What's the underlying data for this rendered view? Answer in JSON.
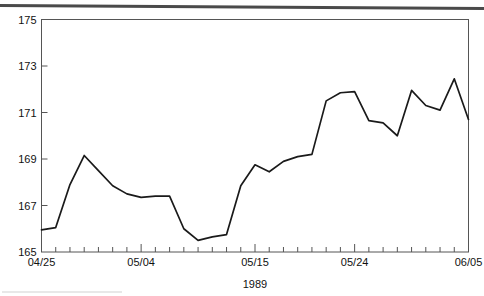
{
  "page": {
    "background_color": "#ffffff",
    "line_color": "#1a1a1a",
    "axis_color": "#555555"
  },
  "chart_data": {
    "type": "line",
    "title": "",
    "subtitle": "",
    "xlabel": "1989",
    "ylabel": "",
    "ylim": [
      165,
      175
    ],
    "ytick_labels": [
      "165",
      "167",
      "169",
      "171",
      "173",
      "175"
    ],
    "ytick_values": [
      165,
      167,
      169,
      171,
      173,
      175
    ],
    "xtick_labels": [
      "04/25",
      "05/04",
      "05/15",
      "05/24",
      "06/05"
    ],
    "xtick_label_indices": [
      0,
      7,
      15,
      22,
      30
    ],
    "grid": false,
    "legend": null,
    "n_ticks": 31,
    "x": [
      "04/25",
      "04/26",
      "04/27",
      "04/28",
      "05/01",
      "05/02",
      "05/03",
      "05/04",
      "05/05",
      "05/08",
      "05/09",
      "05/10",
      "05/11",
      "05/12",
      "05/15",
      "05/16",
      "05/17",
      "05/18",
      "05/19",
      "05/22",
      "05/23",
      "05/24",
      "05/25",
      "05/26",
      "05/30",
      "05/31",
      "06/01",
      "06/02",
      "06/05",
      "06/06",
      "06/07"
    ],
    "values": [
      165.95,
      166.05,
      167.9,
      169.15,
      168.5,
      167.85,
      167.5,
      167.35,
      167.4,
      167.4,
      166.0,
      165.5,
      165.65,
      165.75,
      167.85,
      168.75,
      168.45,
      168.9,
      169.1,
      169.2,
      171.5,
      171.85,
      171.9,
      170.65,
      170.55,
      170.0,
      171.95,
      171.3,
      171.1,
      172.45,
      170.7
    ],
    "source_note": ""
  }
}
